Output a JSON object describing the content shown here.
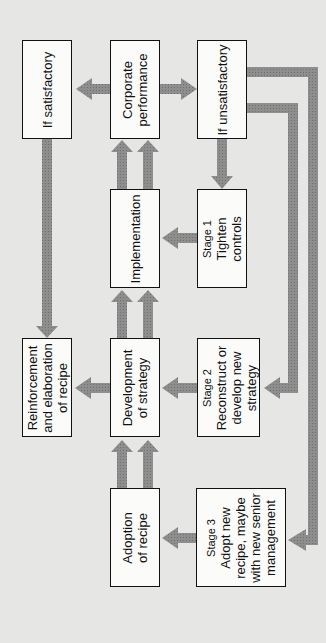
{
  "diagram": {
    "colors": {
      "background": "#e6e6e4",
      "box_fill": "#fbfbfa",
      "box_border": "#111111",
      "arrow": "#8a8a8a"
    },
    "nodes": {
      "if_satisfactory": {
        "lines": [
          "If satisfactory"
        ]
      },
      "corporate_performance": {
        "lines": [
          "Corporate",
          "performance"
        ]
      },
      "if_unsatisfactory": {
        "lines": [
          "If unsatisfactory"
        ]
      },
      "implementation": {
        "lines": [
          "Implementation"
        ]
      },
      "stage1": {
        "stage": "Stage 1",
        "lines": [
          "Tighten",
          "controls"
        ]
      },
      "reinforcement": {
        "lines": [
          "Reinforcement",
          "and elaboration",
          "of recipe"
        ]
      },
      "development": {
        "lines": [
          "Development",
          "of strategy"
        ]
      },
      "stage2": {
        "stage": "Stage 2",
        "lines": [
          "Reconstruct or",
          "develop new",
          "strategy"
        ]
      },
      "adoption": {
        "lines": [
          "Adoption",
          "of recipe"
        ]
      },
      "stage3": {
        "stage": "Stage 3",
        "lines": [
          "Adopt new",
          "recipe, maybe",
          "with new senior",
          "management"
        ]
      }
    },
    "edges": [
      {
        "from": "corporate_performance",
        "to": "if_satisfactory"
      },
      {
        "from": "corporate_performance",
        "to": "if_unsatisfactory"
      },
      {
        "from": "implementation",
        "to": "corporate_performance"
      },
      {
        "from": "if_unsatisfactory",
        "to": "stage1"
      },
      {
        "from": "stage1",
        "to": "implementation"
      },
      {
        "from": "if_satisfactory",
        "to": "reinforcement"
      },
      {
        "from": "development",
        "to": "implementation"
      },
      {
        "from": "development",
        "to": "reinforcement"
      },
      {
        "from": "stage2",
        "to": "development"
      },
      {
        "from": "if_unsatisfactory",
        "to": "stage2"
      },
      {
        "from": "adoption",
        "to": "development"
      },
      {
        "from": "stage3",
        "to": "adoption"
      },
      {
        "from": "if_unsatisfactory",
        "to": "stage3"
      }
    ]
  }
}
